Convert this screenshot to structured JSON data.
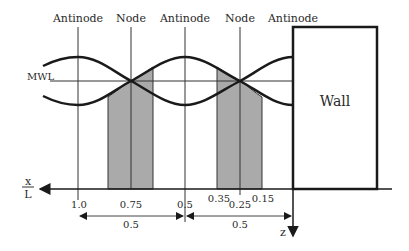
{
  "diagram": {
    "top_labels": [
      "Antinode",
      "Node",
      "Antinode",
      "Node",
      "Antinode"
    ],
    "mwl_label": "MWL",
    "wall_label": "Wall",
    "axis_label_x": "x",
    "axis_label_L": "L",
    "axis_label_z": "z",
    "ticks": [
      "1.0",
      "0.75",
      "0.5",
      "0.35",
      "0.25",
      "0.15"
    ],
    "dimensions": [
      "0.5",
      "0.5"
    ],
    "colors": {
      "line": "#1a1a1a",
      "shade": "#aaaaaa",
      "background": "#ffffff"
    }
  }
}
